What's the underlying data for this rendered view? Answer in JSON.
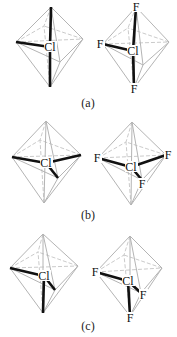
{
  "figure": {
    "colors": {
      "edge": "#b4b4b4",
      "bond": "#111111",
      "text": "#111111"
    },
    "panels": [
      {
        "label": "(a)",
        "label_pos": [
          88,
          107
        ],
        "molecules": [
          {
            "name": "a-left",
            "center": {
              "symbol": "Cl",
              "pos": [
                50,
                47
              ]
            },
            "vertices": {
              "top": [
                51,
                7
              ],
              "left": [
                16,
                42
              ],
              "right": [
                83,
                39
              ],
              "bottom": [
                50,
                87
              ],
              "front": [
                60,
                62
              ],
              "back": [
                44,
                26
              ]
            },
            "bonds": [
              "top",
              "left",
              "bottom"
            ],
            "ligands": []
          },
          {
            "name": "a-right",
            "center": {
              "symbol": "Cl",
              "pos": [
                133,
                51
              ]
            },
            "vertices": {
              "top": [
                136,
                7
              ],
              "left": [
                103,
                44
              ],
              "right": [
                169,
                42
              ],
              "bottom": [
                134,
                88
              ],
              "front": [
                143,
                65
              ],
              "back": [
                128,
                28
              ]
            },
            "bonds": [
              "top",
              "left",
              "bottom"
            ],
            "ligands": [
              {
                "symbol": "F",
                "at": "top",
                "pos": [
                  136,
                  7
                ]
              },
              {
                "symbol": "F",
                "at": "left",
                "pos": [
                  100,
                  44
                ]
              },
              {
                "symbol": "F",
                "at": "bottom",
                "pos": [
                  134,
                  89
                ]
              }
            ]
          }
        ]
      },
      {
        "label": "(b)",
        "label_pos": [
          88,
          219
        ],
        "molecules": [
          {
            "name": "b-left",
            "center": {
              "symbol": "Cl",
              "pos": [
                46,
                163
              ]
            },
            "vertices": {
              "top": [
                46,
                121
              ],
              "left": [
                12,
                157
              ],
              "right": [
                81,
                155
              ],
              "bottom": [
                44,
                203
              ],
              "front": [
                58,
                178
              ],
              "back": [
                40,
                140
              ]
            },
            "bonds": [
              "left",
              "right",
              "front"
            ],
            "ligands": []
          },
          {
            "name": "b-right",
            "center": {
              "symbol": "Cl",
              "pos": [
                131,
                167
              ]
            },
            "vertices": {
              "top": [
                132,
                122
              ],
              "left": [
                98,
                158
              ],
              "right": [
                166,
                155
              ],
              "bottom": [
                131,
                205
              ],
              "front": [
                142,
                180
              ],
              "back": [
                126,
                142
              ]
            },
            "bonds": [
              "left",
              "right",
              "front"
            ],
            "ligands": [
              {
                "symbol": "F",
                "at": "left",
                "pos": [
                  97,
                  158
                ]
              },
              {
                "symbol": "F",
                "at": "right",
                "pos": [
                  168,
                  155
                ]
              },
              {
                "symbol": "F",
                "at": "front",
                "pos": [
                  142,
                  184
                ]
              }
            ]
          }
        ]
      },
      {
        "label": "(c)",
        "label_pos": [
          88,
          330
        ],
        "molecules": [
          {
            "name": "c-left",
            "center": {
              "symbol": "Cl",
              "pos": [
                44,
                276
              ]
            },
            "vertices": {
              "top": [
                43,
                234
              ],
              "left": [
                10,
                268
              ],
              "right": [
                78,
                266
              ],
              "bottom": [
                43,
                313
              ],
              "front": [
                55,
                290
              ],
              "back": [
                38,
                252
              ]
            },
            "bonds": [
              "left",
              "front",
              "bottom"
            ],
            "ligands": []
          },
          {
            "name": "c-right",
            "center": {
              "symbol": "Cl",
              "pos": [
                128,
                281
              ]
            },
            "vertices": {
              "top": [
                130,
                236
              ],
              "left": [
                96,
                272
              ],
              "right": [
                162,
                268
              ],
              "bottom": [
                130,
                316
              ],
              "front": [
                141,
                293
              ],
              "back": [
                124,
                255
              ]
            },
            "bonds": [
              "left",
              "front",
              "bottom"
            ],
            "ligands": [
              {
                "symbol": "F",
                "at": "left",
                "pos": [
                  95,
                  272
                ]
              },
              {
                "symbol": "F",
                "at": "front",
                "pos": [
                  143,
                  295
                ]
              },
              {
                "symbol": "F",
                "at": "bottom",
                "pos": [
                  130,
                  318
                ]
              }
            ]
          }
        ]
      }
    ]
  }
}
